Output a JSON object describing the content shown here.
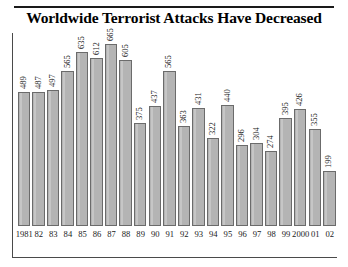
{
  "chart": {
    "title": "Worldwide Terrorist Attacks Have Decreased"
  },
  "chart_data": {
    "type": "bar",
    "title": "Worldwide Terrorist Attacks Have Decreased",
    "xlabel": "",
    "ylabel": "",
    "ylim": [
      0,
      700
    ],
    "grid": false,
    "legend": false,
    "bar_color": "#b4b4b4",
    "bar_edge_color": "#6b6b6b",
    "value_labels": true,
    "value_label_rotation": 90,
    "categories": [
      "1981",
      "82",
      "83",
      "84",
      "85",
      "86",
      "87",
      "88",
      "89",
      "90",
      "91",
      "92",
      "93",
      "94",
      "95",
      "96",
      "97",
      "98",
      "99",
      "2000",
      "01",
      "02"
    ],
    "values": [
      489,
      487,
      497,
      565,
      635,
      612,
      665,
      605,
      375,
      437,
      565,
      363,
      431,
      322,
      440,
      296,
      304,
      274,
      395,
      426,
      355,
      199
    ]
  }
}
